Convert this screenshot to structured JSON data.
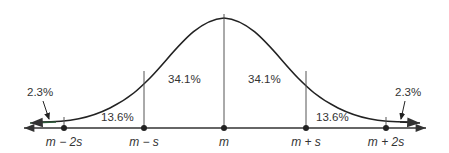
{
  "diagram": {
    "type": "normal-distribution",
    "regions": [
      {
        "id": "left-tail",
        "label": "2.3%"
      },
      {
        "id": "left-outer",
        "label": "13.6%"
      },
      {
        "id": "left-inner",
        "label": "34.1%"
      },
      {
        "id": "right-inner",
        "label": "34.1%"
      },
      {
        "id": "right-outer",
        "label": "13.6%"
      },
      {
        "id": "right-tail",
        "label": "2.3%"
      }
    ],
    "axis_labels": [
      {
        "id": "m-minus-2s",
        "label": "m − 2s"
      },
      {
        "id": "m-minus-s",
        "label": "m − s"
      },
      {
        "id": "m",
        "label": "m"
      },
      {
        "id": "m-plus-s",
        "label": "m + s"
      },
      {
        "id": "m-plus-2s",
        "label": "m + 2s"
      }
    ],
    "colors": {
      "curve": "#222222",
      "axis": "#333333",
      "tail_arrow": "#2e5a3a",
      "text": "#333333"
    }
  }
}
